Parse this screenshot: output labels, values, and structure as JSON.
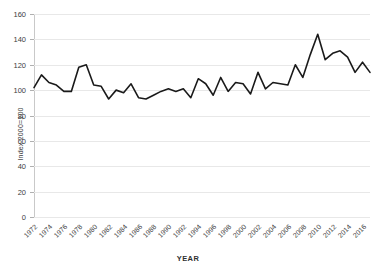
{
  "chart_data": {
    "type": "line",
    "title": "",
    "xlabel": "YEAR",
    "ylabel": "Index 2000=100",
    "ylim": [
      0,
      160
    ],
    "yticks": [
      0,
      20,
      40,
      60,
      80,
      100,
      120,
      140,
      160
    ],
    "grid": true,
    "legend": "none",
    "series_color": "#1a1a1a",
    "xtick_labels": [
      "1972",
      "1974",
      "1976",
      "1978",
      "1980",
      "1982",
      "1984",
      "1986",
      "1988",
      "1990",
      "1992",
      "1994",
      "1996",
      "1998",
      "2000",
      "2002",
      "2004",
      "2006",
      "2008",
      "2010",
      "2012",
      "2014",
      "2016"
    ],
    "x": [
      1972,
      1973,
      1974,
      1975,
      1976,
      1977,
      1978,
      1979,
      1980,
      1981,
      1982,
      1983,
      1984,
      1985,
      1986,
      1987,
      1988,
      1989,
      1990,
      1991,
      1992,
      1993,
      1994,
      1995,
      1996,
      1997,
      1998,
      1999,
      2000,
      2001,
      2002,
      2003,
      2004,
      2005,
      2006,
      2007,
      2008,
      2009,
      2010,
      2011,
      2012,
      2013,
      2014,
      2015,
      2016,
      2017
    ],
    "values": [
      102,
      112,
      106,
      104,
      99,
      99,
      118,
      120,
      104,
      103,
      93,
      100,
      98,
      105,
      94,
      93,
      96,
      99,
      101,
      99,
      101,
      94,
      109,
      105,
      96,
      110,
      99,
      106,
      105,
      97,
      114,
      101,
      106,
      105,
      104,
      120,
      110,
      128,
      144,
      124,
      129,
      131,
      126,
      114,
      122,
      114
    ],
    "series": [
      {
        "name": "Index 2000=100",
        "values": [
          102,
          112,
          106,
          104,
          99,
          99,
          118,
          120,
          104,
          103,
          93,
          100,
          98,
          105,
          94,
          93,
          96,
          99,
          101,
          99,
          101,
          94,
          109,
          105,
          96,
          110,
          99,
          106,
          105,
          97,
          114,
          101,
          106,
          105,
          104,
          120,
          110,
          128,
          144,
          124,
          129,
          131,
          126,
          114,
          122,
          114
        ]
      }
    ],
    "xlim": [
      1972,
      2017
    ]
  }
}
